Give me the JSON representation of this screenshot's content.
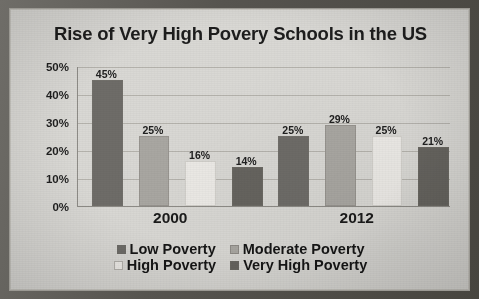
{
  "frame": {
    "paper_color": "#d9d8d4",
    "border_color": "#55534f"
  },
  "chart_data": {
    "type": "bar",
    "title": "Rise of Very High Povery Schools in the US",
    "xlabel": "",
    "ylabel": "",
    "categories": [
      "2000",
      "2012"
    ],
    "series": [
      {
        "name": "Low Poverty",
        "values": [
          45,
          25
        ],
        "color": "#6e6c68"
      },
      {
        "name": "Moderate Poverty",
        "values": [
          25,
          29
        ],
        "color": "#a9a7a2"
      },
      {
        "name": "High Poverty",
        "values": [
          16,
          25
        ],
        "color": "#eceae6"
      },
      {
        "name": "Very High Poverty",
        "values": [
          14,
          21
        ],
        "color": "#66645f"
      }
    ],
    "data_labels": [
      "45%",
      "25%",
      "16%",
      "14%",
      "25%",
      "29%",
      "25%",
      "21%"
    ],
    "ylim": [
      0,
      50
    ],
    "yticks": [
      0,
      10,
      20,
      30,
      40,
      50
    ],
    "ytick_labels": [
      "0%",
      "10%",
      "20%",
      "30%",
      "40%",
      "50%"
    ],
    "grid": true,
    "grid_axis": "y",
    "legend_position": "bottom",
    "legend_rows": [
      [
        "Low Poverty",
        "Moderate Poverty"
      ],
      [
        "High Poverty",
        "Very High Poverty"
      ]
    ]
  }
}
